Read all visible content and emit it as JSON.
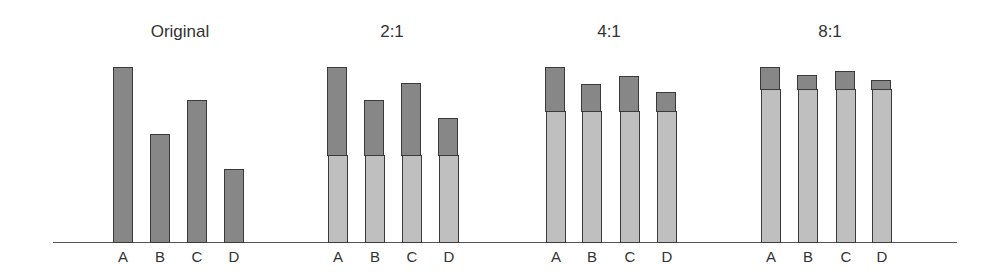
{
  "chart_data": {
    "type": "bar",
    "subtype": "stacked-bar small multiples",
    "title": "",
    "xlabel": "",
    "ylabel": "",
    "grid": false,
    "legend": null,
    "ylim": [
      0,
      100
    ],
    "categories": [
      "A",
      "B",
      "C",
      "D"
    ],
    "panels": [
      {
        "title": "Original",
        "series": [
          {
            "name": "value",
            "color": "#8e8e8e",
            "values": [
              100,
              62,
              81,
              42
            ]
          }
        ],
        "totals": [
          100,
          62,
          81,
          42
        ]
      },
      {
        "title": "2:1",
        "series": [
          {
            "name": "base",
            "color": "#c6c6c6",
            "values": [
              50,
              50,
              50,
              50
            ]
          },
          {
            "name": "scaled",
            "color": "#8e8e8e",
            "values": [
              50,
              31,
              41,
              21
            ]
          }
        ],
        "totals": [
          100,
          81,
          91,
          71
        ]
      },
      {
        "title": "4:1",
        "series": [
          {
            "name": "base",
            "color": "#c6c6c6",
            "values": [
              75,
              75,
              75,
              75
            ]
          },
          {
            "name": "scaled",
            "color": "#8e8e8e",
            "values": [
              25,
              15.5,
              20,
              10.5
            ]
          }
        ],
        "totals": [
          100,
          90.5,
          95,
          85.5
        ]
      },
      {
        "title": "8:1",
        "series": [
          {
            "name": "base",
            "color": "#c6c6c6",
            "values": [
              87.5,
              87.5,
              87.5,
              87.5
            ]
          },
          {
            "name": "scaled",
            "color": "#8e8e8e",
            "values": [
              12.5,
              7.75,
              10,
              5.25
            ]
          }
        ],
        "totals": [
          100,
          95.25,
          97.5,
          92.75
        ]
      }
    ]
  },
  "layout": {
    "baseline_y": 242,
    "px_per_unit": 1.75,
    "bar_width": 20,
    "panels_x": [
      [
        113,
        150,
        187,
        224
      ],
      [
        328,
        365,
        402,
        439
      ],
      [
        546,
        582,
        620,
        657
      ],
      [
        761,
        798,
        836,
        872
      ]
    ],
    "title_centers": [
      180,
      392,
      609,
      830
    ]
  }
}
